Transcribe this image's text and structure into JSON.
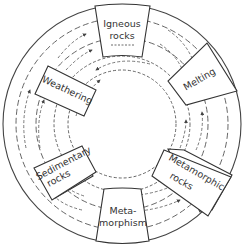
{
  "diagram": {
    "type": "rock-cycle",
    "nodes": [
      {
        "id": "igneous",
        "label_line1": "Igneous",
        "label_line2": "rocks"
      },
      {
        "id": "melting",
        "label_line1": "Melting"
      },
      {
        "id": "metamorphic",
        "label_line1": "Metamorphic",
        "label_line2": "rocks"
      },
      {
        "id": "metamorphism",
        "label_line1": "Meta-",
        "label_line2": "morphism"
      },
      {
        "id": "sedimentary",
        "label_line1": "Sedimentary",
        "label_line2": "rocks"
      },
      {
        "id": "weathering",
        "label_line1": "Weathering"
      }
    ],
    "colors": {
      "line": "#333333",
      "background": "#ffffff"
    }
  }
}
